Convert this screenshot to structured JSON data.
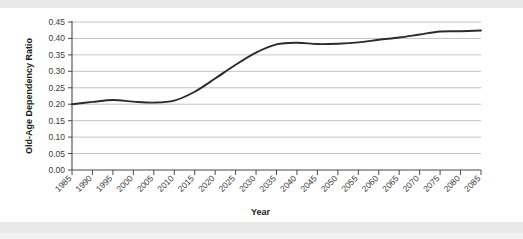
{
  "chart_data": {
    "type": "line",
    "title": "",
    "xlabel": "Year",
    "ylabel": "Old-Age Dependency Ratio",
    "xlim": [
      1985,
      2085
    ],
    "ylim": [
      0.0,
      0.45
    ],
    "grid": true,
    "legend": null,
    "y_ticks": [
      "0.00",
      "0.05",
      "0.10",
      "0.15",
      "0.20",
      "0.25",
      "0.30",
      "0.35",
      "0.40",
      "0.45"
    ],
    "y_tick_values": [
      0.0,
      0.05,
      0.1,
      0.15,
      0.2,
      0.25,
      0.3,
      0.35,
      0.4,
      0.45
    ],
    "categories": [
      "1985",
      "1990",
      "1995",
      "2000",
      "2005",
      "2010",
      "2015",
      "2020",
      "2025",
      "2030",
      "2035",
      "2040",
      "2045",
      "2050",
      "2055",
      "2060",
      "2065",
      "2070",
      "2075",
      "2080",
      "2085"
    ],
    "x": [
      1985,
      1990,
      1995,
      2000,
      2005,
      2010,
      2015,
      2020,
      2025,
      2030,
      2035,
      2040,
      2045,
      2050,
      2055,
      2060,
      2065,
      2070,
      2075,
      2080,
      2085
    ],
    "series": [
      {
        "name": "Old-Age Dependency Ratio",
        "color": "#2b2b2b",
        "values": [
          0.2,
          0.207,
          0.213,
          0.208,
          0.205,
          0.211,
          0.238,
          0.278,
          0.32,
          0.357,
          0.382,
          0.387,
          0.383,
          0.384,
          0.388,
          0.396,
          0.403,
          0.412,
          0.421,
          0.422,
          0.424
        ]
      }
    ]
  },
  "axis": {
    "x_title": "Year",
    "y_title": "Old-Age Dependency Ratio"
  }
}
